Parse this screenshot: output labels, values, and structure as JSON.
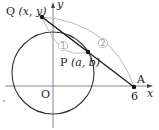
{
  "diagram": {
    "axes": {
      "x_label": "x",
      "y_label": "y",
      "origin_label": "O"
    },
    "points": {
      "Q": {
        "name": "Q",
        "coords": "(x, y)"
      },
      "P": {
        "name": "P",
        "coords": "(a, b)"
      },
      "A": {
        "name": "A",
        "x_value": "6"
      }
    },
    "segment_labels": [
      "①",
      "②"
    ],
    "colors": {
      "stroke": "#222222",
      "arc": "#999999"
    }
  }
}
